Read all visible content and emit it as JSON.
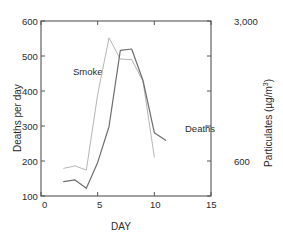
{
  "chart_data": {
    "type": "line",
    "title": "",
    "xlabel": "DAY",
    "ylabel": "Deaths per day",
    "y2label": "Particulates (µg/m³)",
    "xlim": [
      0,
      15
    ],
    "ylim": [
      100,
      600
    ],
    "y2lim": [
      600,
      3000
    ],
    "grid": false,
    "legend_position": "inline-annotations",
    "xticks": [
      "0",
      "5",
      "10",
      "15"
    ],
    "xtick_values": [
      0,
      5,
      10,
      15
    ],
    "yticks": [
      "100",
      "200",
      "300",
      "400",
      "500",
      "600"
    ],
    "ytick_values": [
      100,
      200,
      300,
      400,
      500,
      600
    ],
    "y2ticks": [
      "600",
      "3,000"
    ],
    "y2tick_values": [
      600,
      3000
    ],
    "y2_minor_tick_values": [
      1080,
      1560,
      2040,
      2520
    ],
    "series": [
      {
        "name": "Deaths",
        "axis": "left",
        "color": "#6e6e6e",
        "x": [
          2,
          3,
          4,
          5,
          6,
          7,
          8,
          9,
          10,
          11
        ],
        "values": [
          141,
          146,
          122,
          196,
          298,
          516,
          520,
          430,
          281,
          259
        ]
      },
      {
        "name": "Smoke",
        "axis": "right",
        "color": "#b5b5b5",
        "x": [
          2,
          3,
          4,
          5,
          6,
          7,
          8,
          9,
          10
        ],
        "values_left_scale": [
          179,
          186,
          174,
          390,
          552,
          491,
          490,
          428,
          211
        ],
        "values": [
          1080,
          1150,
          1050,
          2490,
          3410,
          2930,
          2920,
          2520,
          1190
        ]
      }
    ],
    "annotations": [
      {
        "text": "Smoke",
        "x_day": 3.55,
        "y_left": 452
      },
      {
        "text": "Deaths",
        "x_day": 10.2,
        "y_left": 300
      }
    ]
  },
  "axes": {
    "left_title": "Deaths per day",
    "right_title": "Particulates (µg/m³)",
    "right_title_main": "Particulates (µg/m",
    "right_title_sup": "3",
    "right_title_tail": ")",
    "bottom_title": "DAY"
  },
  "colors": {
    "frame": "#555555",
    "deaths_line": "#6e6e6e",
    "smoke_line": "#b5b5b5",
    "text": "#2b2b2b",
    "background": "#ffffff"
  }
}
